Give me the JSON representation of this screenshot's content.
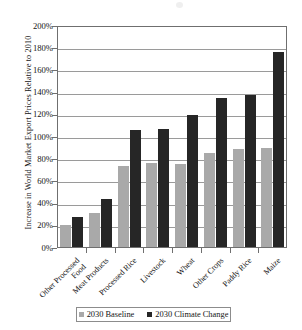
{
  "chart_data": {
    "type": "bar",
    "title": "",
    "xlabel": "",
    "ylabel": "Increase in World Market Export Prices Relative to 2010",
    "ylim": [
      0,
      200
    ],
    "ytick_labels": [
      "200%",
      "180%",
      "160%",
      "140%",
      "120%",
      "100%",
      "80%",
      "60%",
      "40%",
      "20%",
      "0%"
    ],
    "ytick_values": [
      200,
      180,
      160,
      140,
      120,
      100,
      80,
      60,
      40,
      20,
      0
    ],
    "grid": true,
    "legend_position": "bottom",
    "categories": [
      "Other Processed Food",
      "Meat Products",
      "Processed Rice",
      "Livestock",
      "Wheat",
      "Other Crops",
      "Paddy Rice",
      "Maize"
    ],
    "category_lines": [
      [
        "Other Processed",
        "Food"
      ],
      [
        "Meat Products"
      ],
      [
        "Processed Rice"
      ],
      [
        "Livestock"
      ],
      [
        "Wheat"
      ],
      [
        "Other Crops"
      ],
      [
        "Paddy Rice"
      ],
      [
        "Maize"
      ]
    ],
    "series": [
      {
        "name": "2030 Baseline",
        "color": "#a9a9a9",
        "values": [
          20,
          31,
          73,
          76,
          75,
          85,
          88,
          89
        ]
      },
      {
        "name": "2030 Climate Change",
        "color": "#262626",
        "values": [
          27,
          43,
          105,
          106,
          119,
          134,
          137,
          176
        ]
      }
    ]
  },
  "legend": {
    "items": [
      {
        "label": "2030 Baseline"
      },
      {
        "label": "2030 Climate Change"
      }
    ]
  }
}
